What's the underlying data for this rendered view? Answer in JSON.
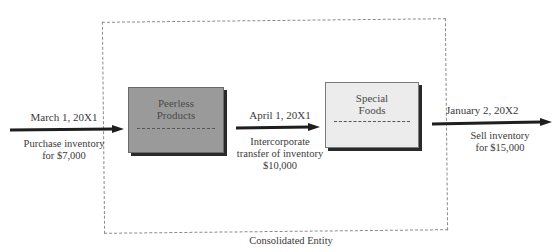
{
  "diagram": {
    "entity_label": "Consolidated Entity",
    "entities": [
      {
        "name_line1": "Peerless",
        "name_line2": "Products",
        "fill": "#9a9a9a"
      },
      {
        "name_line1": "Special",
        "name_line2": "Foods",
        "fill": "#ececec"
      }
    ],
    "flows": [
      {
        "date": "March 1, 20X1",
        "desc_line1": "Purchase inventory",
        "desc_line2": "for $7,000"
      },
      {
        "date": "April 1, 20X1",
        "desc_line1": "Intercorporate",
        "desc_line2": "transfer of inventory",
        "desc_line3": "$10,000"
      },
      {
        "date": "January 2, 20X2",
        "desc_line1": "Sell inventory",
        "desc_line2": "for $15,000"
      }
    ]
  }
}
